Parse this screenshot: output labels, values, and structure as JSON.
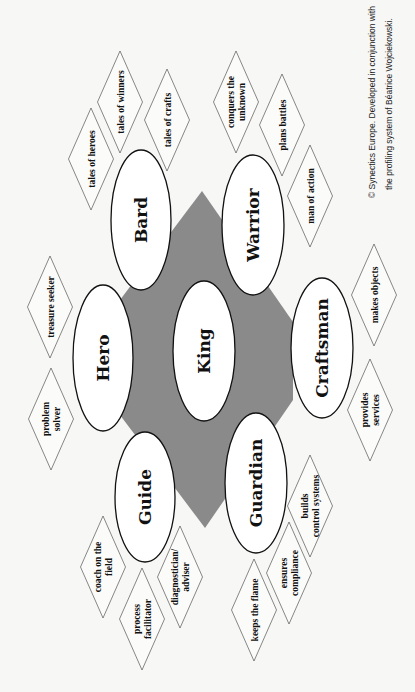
{
  "diagram": {
    "center_shape": {
      "fill": "#8a8a8a"
    },
    "roles": [
      {
        "id": "king",
        "label": "King",
        "cx": 204,
        "cy": 351,
        "rx": 31,
        "ry": 70
      },
      {
        "id": "hero",
        "label": "Hero",
        "cx": 103,
        "cy": 358,
        "rx": 30,
        "ry": 73
      },
      {
        "id": "bard",
        "label": "Bard",
        "cx": 141,
        "cy": 220,
        "rx": 30,
        "ry": 70
      },
      {
        "id": "warrior",
        "label": "Warrior",
        "cx": 253,
        "cy": 225,
        "rx": 31,
        "ry": 70
      },
      {
        "id": "craftsman",
        "label": "Craftsman",
        "cx": 322,
        "cy": 348,
        "rx": 31,
        "ry": 70
      },
      {
        "id": "guardian",
        "label": "Guardian",
        "cx": 256,
        "cy": 483,
        "rx": 31,
        "ry": 70
      },
      {
        "id": "guide",
        "label": "Guide",
        "cx": 145,
        "cy": 497,
        "rx": 30,
        "ry": 65
      }
    ],
    "traits": [
      {
        "role": "bard",
        "lines": [
          "tales of heroes"
        ],
        "cx": 91,
        "cy": 159
      },
      {
        "role": "bard",
        "lines": [
          "tales of winners"
        ],
        "cx": 120,
        "cy": 102
      },
      {
        "role": "bard",
        "lines": [
          "tales of crafts"
        ],
        "cx": 167,
        "cy": 120
      },
      {
        "role": "warrior",
        "lines": [
          "conquers the",
          "unknown"
        ],
        "cx": 236,
        "cy": 102
      },
      {
        "role": "warrior",
        "lines": [
          "plans battles"
        ],
        "cx": 282,
        "cy": 125
      },
      {
        "role": "warrior",
        "lines": [
          "man of action"
        ],
        "cx": 310,
        "cy": 196
      },
      {
        "role": "hero",
        "lines": [
          "treasure seeker"
        ],
        "cx": 50,
        "cy": 307
      },
      {
        "role": "hero",
        "lines": [
          "problem",
          "solver"
        ],
        "cx": 51,
        "cy": 419
      },
      {
        "role": "craftsman",
        "lines": [
          "makes objects"
        ],
        "cx": 374,
        "cy": 295
      },
      {
        "role": "craftsman",
        "lines": [
          "provides",
          "services"
        ],
        "cx": 370,
        "cy": 410
      },
      {
        "role": "guide",
        "lines": [
          "coach on the",
          "field"
        ],
        "cx": 103,
        "cy": 567
      },
      {
        "role": "guide",
        "lines": [
          "process",
          "facilitator"
        ],
        "cx": 142,
        "cy": 619
      },
      {
        "role": "guide",
        "lines": [
          "diagnostician/",
          "adviser"
        ],
        "cx": 180,
        "cy": 577
      },
      {
        "role": "guardian",
        "lines": [
          "builds",
          "control systems"
        ],
        "cx": 310,
        "cy": 506
      },
      {
        "role": "guardian",
        "lines": [
          "ensures",
          "compliance"
        ],
        "cx": 289,
        "cy": 573
      },
      {
        "role": "guardian",
        "lines": [
          "keeps the flame"
        ],
        "cx": 254,
        "cy": 610
      }
    ],
    "copyright": {
      "line1": "© Synectics Europe. Developed in conjunction with",
      "line2": "the profiling system of Béatrice Wojciekowski."
    }
  }
}
